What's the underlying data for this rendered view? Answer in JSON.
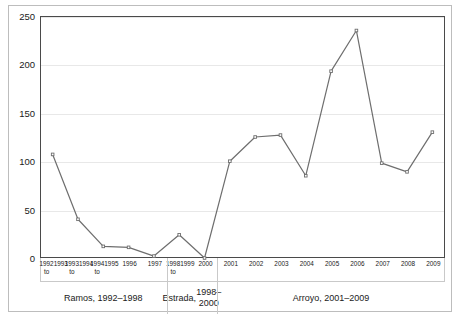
{
  "chart_data": {
    "type": "line",
    "title": "",
    "subtitle": "",
    "xlabel": "",
    "ylabel": "",
    "ylim": [
      0,
      250
    ],
    "yticks": [
      0,
      50,
      100,
      150,
      200,
      250
    ],
    "grid": true,
    "legend": false,
    "marker": "square",
    "line_color": "#6e6e6e",
    "categories": [
      "1992 to\n1993",
      "1993 to\n1994",
      "1994 to\n1995",
      "1996",
      "1997",
      "1998 to\n1999",
      "2000",
      "2001",
      "2002",
      "2003",
      "2004",
      "2005",
      "2006",
      "2007",
      "2008",
      "2009"
    ],
    "values": [
      107,
      40,
      12,
      11,
      2,
      24,
      0,
      100,
      125,
      127,
      85,
      193,
      235,
      98,
      89,
      130
    ],
    "groups": [
      {
        "label": "Ramos, 1992–1998",
        "start": 0,
        "end": 4
      },
      {
        "label": "Estrada,\n1998–2000",
        "start": 5,
        "end": 6
      },
      {
        "label": "Arroyo, 2001–2009",
        "start": 7,
        "end": 15
      }
    ]
  }
}
